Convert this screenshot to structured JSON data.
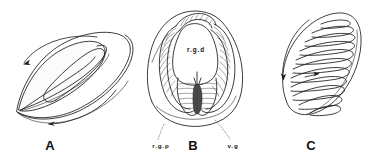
{
  "figure": {
    "type": "scientific-line-illustration",
    "background_color": "#ffffff",
    "ink_color": "#1a1a1a",
    "panel_count": 3
  },
  "panels": [
    {
      "id": "A",
      "letter": "A",
      "description": "Lateral outline of a flattened lamelliform gill showing two curved circulation arrows, an outer mantle-like sheath and an inner elongate lobe",
      "labels": [],
      "arrows": [
        {
          "name": "upper-flow-arrow",
          "direction": "counter-clockwise-left"
        },
        {
          "name": "lower-flow-arrow",
          "direction": "left"
        }
      ]
    },
    {
      "id": "B",
      "letter": "B",
      "description": "Frontal view of a bilobed gill mass with striated filament bands enclosing a central chamber, set within a rounded body outline",
      "labels": [
        {
          "name": "rgd",
          "text": "r.g.d",
          "position": "center",
          "leader": false
        },
        {
          "name": "rgp",
          "text": "r.g.p",
          "position": "lower-left",
          "leader": true
        },
        {
          "name": "vg",
          "text": "v.g",
          "position": "lower-right",
          "leader": true
        }
      ],
      "arrows": []
    },
    {
      "id": "C",
      "letter": "C",
      "description": "Oblique view of an ovoid gill with a series of transverse lamellar folds and a curved marginal flow arrow",
      "labels": [],
      "arrows": [
        {
          "name": "marginal-flow-arrow",
          "direction": "down-left"
        },
        {
          "name": "internal-flow-arrow",
          "direction": "right"
        }
      ]
    }
  ],
  "legend_text": {
    "rgd_full": "r.g.d",
    "rgp_full": "r.g.p",
    "vg_full": "v.g"
  }
}
